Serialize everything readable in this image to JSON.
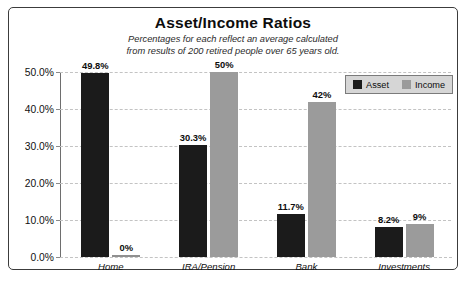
{
  "chart_data": {
    "type": "bar",
    "title": "Asset/Income Ratios",
    "subtitle_line1": "Percentages for each reflect an average calculated",
    "subtitle_line2": "from results of 200 retired people over 65 years old.",
    "xlabel": "",
    "ylabel": "",
    "ylim": [
      0,
      50
    ],
    "grid": true,
    "legend_position": "top-right",
    "categories": [
      "Home",
      "IRA/Pension",
      "Bank",
      "Investments"
    ],
    "ytick_labels": [
      "50.0%",
      "40.0%",
      "30.0%",
      "20.0%",
      "10.0%",
      "0.0%"
    ],
    "ytick_values": [
      50,
      40,
      30,
      20,
      10,
      0
    ],
    "series": [
      {
        "name": "Asset",
        "color": "#1b1b1b",
        "values": [
          49.8,
          30.3,
          11.7,
          8.2
        ],
        "labels": [
          "49.8%",
          "30.3%",
          "11.7%",
          "8.2%"
        ]
      },
      {
        "name": "Income",
        "color": "#9b9b9b",
        "values": [
          0,
          50,
          42,
          9
        ],
        "labels": [
          "0%",
          "50%",
          "42%",
          "9%"
        ]
      }
    ]
  }
}
